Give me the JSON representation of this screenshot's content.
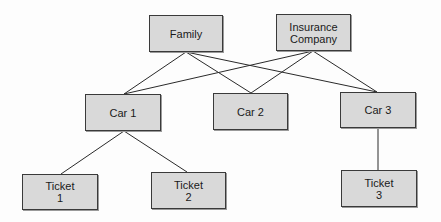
{
  "diagram": {
    "type": "hierarchy",
    "nodes": [
      {
        "id": "family",
        "lines": [
          "Family"
        ],
        "x": 149,
        "y": 15,
        "w": 74,
        "h": 37
      },
      {
        "id": "insurance",
        "lines": [
          "Insurance",
          "Company"
        ],
        "x": 276,
        "y": 14,
        "w": 75,
        "h": 37
      },
      {
        "id": "car1",
        "lines": [
          "Car 1"
        ],
        "x": 85,
        "y": 94,
        "w": 76,
        "h": 37
      },
      {
        "id": "car2",
        "lines": [
          "Car 2"
        ],
        "x": 213,
        "y": 93,
        "w": 75,
        "h": 37
      },
      {
        "id": "car3",
        "lines": [
          "Car 3"
        ],
        "x": 340,
        "y": 92,
        "w": 76,
        "h": 36
      },
      {
        "id": "ticket1",
        "lines": [
          "Ticket",
          "1"
        ],
        "x": 22,
        "y": 174,
        "w": 76,
        "h": 36
      },
      {
        "id": "ticket2",
        "lines": [
          "Ticket",
          "2"
        ],
        "x": 151,
        "y": 172,
        "w": 75,
        "h": 37
      },
      {
        "id": "ticket3",
        "lines": [
          "Ticket",
          "3"
        ],
        "x": 341,
        "y": 170,
        "w": 76,
        "h": 37
      }
    ],
    "edges": [
      {
        "from": "family",
        "to": "car1"
      },
      {
        "from": "family",
        "to": "car2"
      },
      {
        "from": "family",
        "to": "car3"
      },
      {
        "from": "insurance",
        "to": "car1"
      },
      {
        "from": "insurance",
        "to": "car2"
      },
      {
        "from": "insurance",
        "to": "car3"
      },
      {
        "from": "car1",
        "to": "ticket1"
      },
      {
        "from": "car1",
        "to": "ticket2"
      },
      {
        "from": "car3",
        "to": "ticket3"
      }
    ],
    "colors": {
      "node_fill": "#d9d9d9",
      "node_border": "#3a3a3a",
      "edge": "#2a2a2a"
    }
  }
}
